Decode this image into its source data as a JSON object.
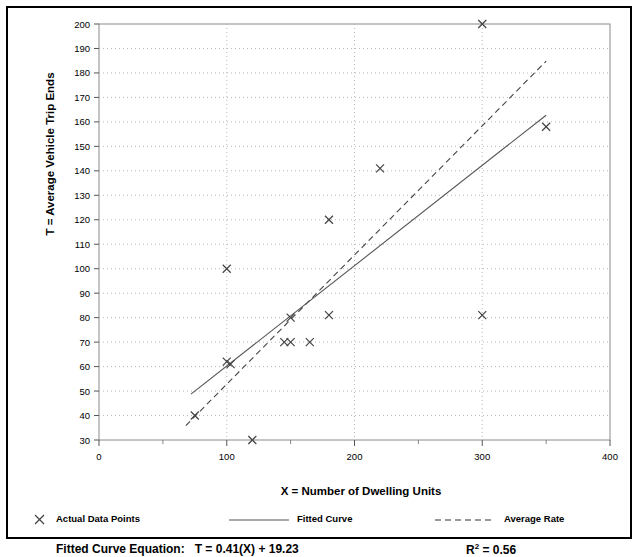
{
  "figure": {
    "border_color": "#000000",
    "background": "#ffffff"
  },
  "axes": {
    "ylabel": "T = Average Vehicle Trip Ends",
    "xlabel": "X = Number of Dwelling Units",
    "y_ticks": [
      30,
      40,
      50,
      60,
      70,
      80,
      90,
      100,
      110,
      120,
      130,
      140,
      150,
      160,
      170,
      180,
      190,
      200
    ],
    "x_ticks": [
      0,
      100,
      200,
      300,
      400
    ],
    "x_minor_ticks": [
      50,
      150,
      250,
      350
    ],
    "x_gridlines": [
      100,
      200,
      300
    ],
    "grid": "dotted"
  },
  "legend": {
    "items": [
      {
        "label": "Actual Data Points",
        "marker": "x-marker"
      },
      {
        "label": "Fitted Curve",
        "marker": "solid-line"
      },
      {
        "label": "Average Rate",
        "marker": "dashed-line"
      }
    ]
  },
  "equation": {
    "fitted_label": "Fitted Curve Equation:",
    "fitted_value": "T = 0.41(X) + 19.23",
    "r2_label": "R",
    "r2_sup": "2",
    "r2_value": " = 0.56"
  },
  "chart_data": {
    "type": "scatter",
    "title": "",
    "xlabel": "X = Number of Dwelling Units",
    "ylabel": "T = Average Vehicle Trip Ends",
    "xlim": [
      0,
      400
    ],
    "ylim": [
      30,
      200
    ],
    "grid": true,
    "legend_position": "below-plot",
    "series": [
      {
        "name": "Actual Data Points",
        "type": "scatter",
        "marker": "x",
        "points": [
          [
            75,
            40
          ],
          [
            100,
            100
          ],
          [
            100,
            62
          ],
          [
            103,
            61
          ],
          [
            120,
            30
          ],
          [
            145,
            70
          ],
          [
            150,
            70
          ],
          [
            150,
            80
          ],
          [
            165,
            70
          ],
          [
            180,
            81
          ],
          [
            180,
            120
          ],
          [
            220,
            141
          ],
          [
            300,
            200
          ],
          [
            300,
            81
          ],
          [
            350,
            158
          ]
        ]
      },
      {
        "name": "Fitted Curve",
        "type": "line",
        "style": "solid",
        "equation": "T = 0.41(X) + 19.23",
        "slope": 0.41,
        "intercept": 19.23,
        "x_range": [
          72,
          350
        ]
      },
      {
        "name": "Average Rate",
        "type": "line",
        "style": "dashed",
        "slope": 0.528,
        "intercept": 0,
        "x_range": [
          68,
          350
        ]
      }
    ]
  }
}
